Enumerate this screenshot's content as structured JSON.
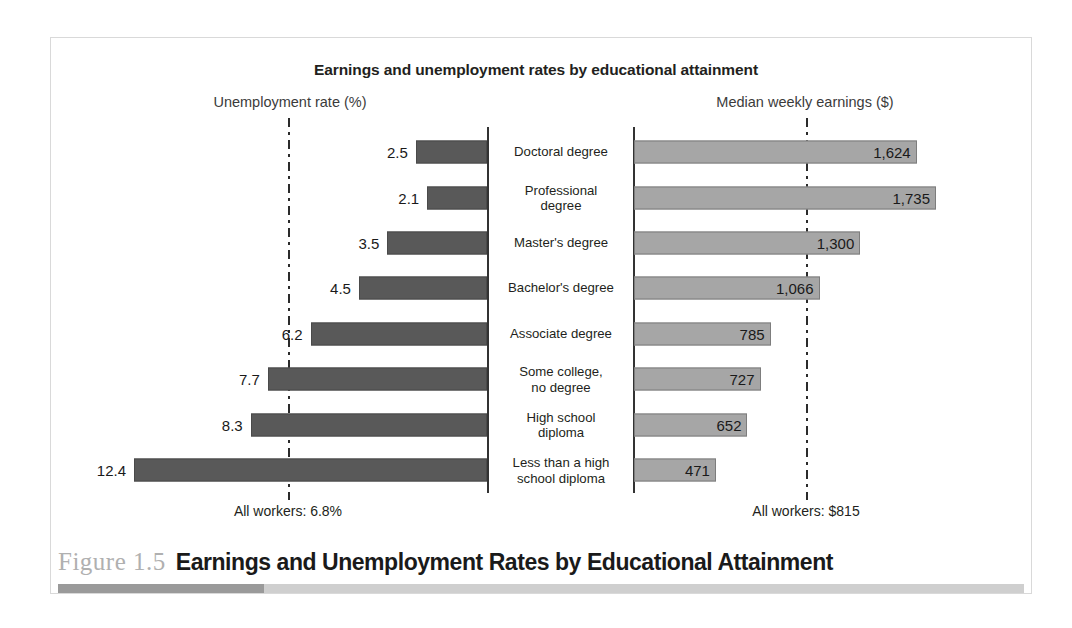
{
  "figure": {
    "number_label": "Figure 1.5",
    "caption_title": "Earnings and Unemployment Rates by Educational Attainment"
  },
  "chart_data": {
    "type": "bar",
    "title": "Earnings and unemployment rates by educational attainment",
    "left_axis_title": "Unemployment rate (%)",
    "right_axis_title": "Median weekly earnings ($)",
    "categories": [
      "Doctoral degree",
      "Professional degree",
      "Master's degree",
      "Bachelor's degree",
      "Associate degree",
      "Some college, no degree",
      "High school diploma",
      "Less than a high school diploma"
    ],
    "category_lines": [
      [
        "Doctoral degree"
      ],
      [
        "Professional",
        "degree"
      ],
      [
        "Master's degree"
      ],
      [
        "Bachelor's degree"
      ],
      [
        "Associate degree"
      ],
      [
        "Some college,",
        "no degree"
      ],
      [
        "High school",
        "diploma"
      ],
      [
        "Less than a high",
        "school diploma"
      ]
    ],
    "series": [
      {
        "name": "Unemployment rate (%)",
        "unit": "%",
        "side": "left",
        "color": "#595959",
        "values": [
          2.5,
          2.1,
          3.5,
          4.5,
          6.2,
          7.7,
          8.3,
          12.4
        ],
        "labels": [
          "2.5",
          "2.1",
          "3.5",
          "4.5",
          "6.2",
          "7.7",
          "8.3",
          "12.4"
        ],
        "max": 12.4,
        "reference_value": 6.8,
        "reference_label": "All workers: 6.8%"
      },
      {
        "name": "Median weekly earnings ($)",
        "unit": "$",
        "side": "right",
        "color": "#a6a6a6",
        "values": [
          1624,
          1735,
          1300,
          1066,
          785,
          727,
          652,
          471
        ],
        "labels": [
          "1,624",
          "1,735",
          "1,300",
          "1,066",
          "785",
          "727",
          "652",
          "471"
        ],
        "max": 1735,
        "reference_value": 815,
        "reference_label": "All workers: $815"
      }
    ],
    "grid": false,
    "legend": "none"
  },
  "colors": {
    "left_bar": "#595959",
    "right_bar": "#a6a6a6",
    "axis": "#333333",
    "reference_line": "#2b2b2b",
    "frame": "#d9d9d9",
    "rule_base": "#cfcfcf",
    "rule_accent": "#9a9a9a",
    "figure_number": "#b0b0b0"
  }
}
